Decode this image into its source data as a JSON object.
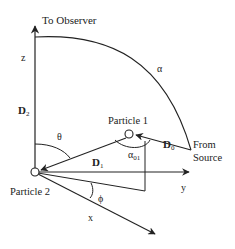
{
  "diagram": {
    "labels": {
      "to_observer": "To Observer",
      "z_axis": "z",
      "y_axis": "y",
      "x_axis": "x",
      "alpha": "α",
      "theta": "θ",
      "phi": "ϕ",
      "alpha01": "α",
      "alpha01_sub": "01",
      "d0": "D",
      "d0_sub": "0",
      "d1": "D",
      "d1_sub": "1",
      "d2": "D",
      "d2_sub": "2",
      "particle1": "Particle 1",
      "particle2": "Particle 2",
      "from_source_line1": "From",
      "from_source_line2": "Source"
    },
    "colors": {
      "stroke": "#222222",
      "background": "#ffffff"
    }
  }
}
